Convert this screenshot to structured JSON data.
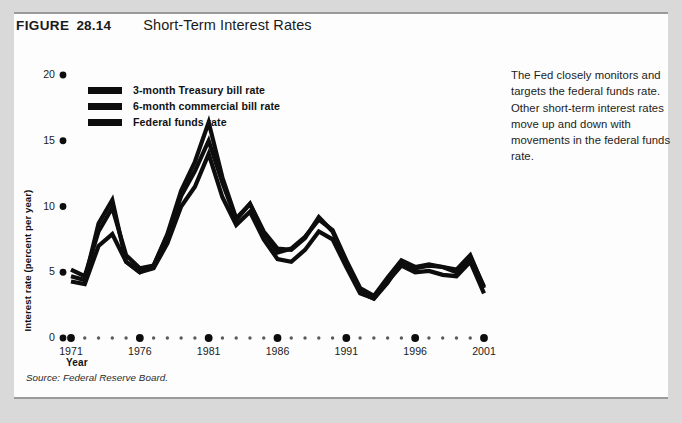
{
  "figure": {
    "label": "FIGURE",
    "number": "28.14",
    "title": "Short-Term Interest Rates",
    "source": "Source: Federal Reserve Board.",
    "caption": "The Fed closely monitors and targets the federal funds rate. Other short-term interest rates move up and down with movements in the federal funds rate."
  },
  "colors": {
    "page_background": "#d9d9d9",
    "card_background": "#fdfdfd",
    "rule": "#9a9a9a",
    "series_line": "#0d0d0d",
    "text": "#1a1a1a"
  },
  "chart_data": {
    "type": "line",
    "title": "Short-Term Interest Rates",
    "xlabel": "Year",
    "ylabel": "Interest rate (percent per year)",
    "xlim": [
      1971,
      2001
    ],
    "ylim": [
      0,
      20
    ],
    "yticks": [
      0,
      5,
      10,
      15,
      20
    ],
    "ytick_labels": [
      "0",
      "5",
      "10",
      "15",
      "20"
    ],
    "xticks": [
      1971,
      1976,
      1981,
      1986,
      1991,
      1996,
      2001
    ],
    "xtick_labels": [
      "1971",
      "1976",
      "1981",
      "1986",
      "1991",
      "1996",
      "2001"
    ],
    "minor_xticks": [
      1972,
      1973,
      1974,
      1975,
      1977,
      1978,
      1979,
      1980,
      1982,
      1983,
      1984,
      1985,
      1987,
      1988,
      1989,
      1990,
      1992,
      1993,
      1994,
      1995,
      1997,
      1998,
      1999,
      2000
    ],
    "grid": false,
    "legend_position": "upper-left-inside",
    "x": [
      1971,
      1972,
      1973,
      1974,
      1975,
      1976,
      1977,
      1978,
      1979,
      1980,
      1981,
      1982,
      1983,
      1984,
      1985,
      1986,
      1987,
      1988,
      1989,
      1990,
      1991,
      1992,
      1993,
      1994,
      1995,
      1996,
      1997,
      1998,
      1999,
      2000,
      2001
    ],
    "series": [
      {
        "name": "3-month Treasury bill rate",
        "values": [
          4.3,
          4.1,
          7.0,
          7.9,
          5.8,
          5.0,
          5.3,
          7.2,
          10.0,
          11.5,
          14.0,
          10.7,
          8.6,
          9.6,
          7.5,
          6.0,
          5.8,
          6.7,
          8.1,
          7.5,
          5.4,
          3.4,
          3.0,
          4.3,
          5.5,
          5.0,
          5.1,
          4.8,
          4.7,
          5.8,
          3.4
        ]
      },
      {
        "name": "6-month commercial bill rate",
        "values": [
          5.2,
          4.7,
          8.1,
          9.9,
          6.3,
          5.3,
          5.5,
          7.8,
          10.8,
          12.7,
          15.0,
          11.8,
          9.0,
          10.2,
          8.0,
          6.5,
          6.8,
          7.7,
          9.0,
          8.2,
          5.9,
          3.8,
          3.2,
          4.6,
          5.9,
          5.4,
          5.6,
          5.4,
          5.2,
          6.3,
          3.8
        ]
      },
      {
        "name": "Federal funds rate",
        "values": [
          4.7,
          4.4,
          8.7,
          10.5,
          5.8,
          5.0,
          5.5,
          7.9,
          11.2,
          13.4,
          16.4,
          12.2,
          9.1,
          10.2,
          8.1,
          6.8,
          6.7,
          7.6,
          9.2,
          8.1,
          5.7,
          3.5,
          3.0,
          4.2,
          5.8,
          5.3,
          5.5,
          5.4,
          5.0,
          6.2,
          3.9
        ]
      }
    ]
  }
}
